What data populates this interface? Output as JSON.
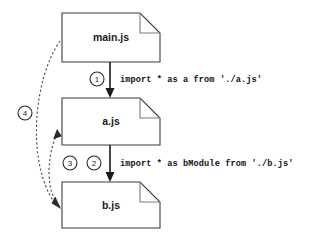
{
  "diagram": {
    "type": "module-import-flow-diagram",
    "background_color": "#ffffff",
    "line_color": "#1b1b1b",
    "dashed_line_color": "#4a4a4a",
    "nodes": [
      {
        "id": "main",
        "label": "main.js",
        "shape": "document"
      },
      {
        "id": "a",
        "label": "a.js",
        "shape": "document"
      },
      {
        "id": "b",
        "label": "b.js",
        "shape": "document"
      }
    ],
    "edges": [
      {
        "id": "edge-1",
        "badge": "1",
        "from": "main.js",
        "to": "a.js",
        "style": "solid",
        "label": "import * as a from './a.js'"
      },
      {
        "id": "edge-2",
        "badge": "2",
        "from": "a.js",
        "to": "b.js",
        "style": "solid",
        "label": "import * as bModule from './b.js'"
      },
      {
        "id": "edge-3",
        "badge": "3",
        "from": "b.js",
        "to": "a.js",
        "style": "dashed",
        "label": ""
      },
      {
        "id": "edge-4",
        "badge": "4",
        "from": "main.js",
        "to": "b.js",
        "style": "dashed",
        "label": ""
      }
    ]
  }
}
